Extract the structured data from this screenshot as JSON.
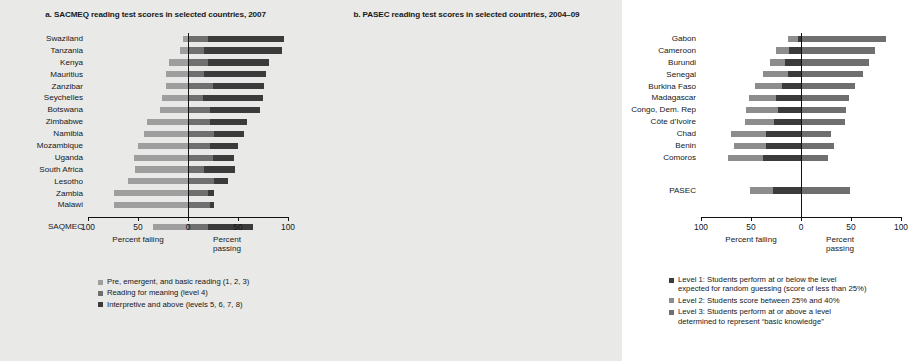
{
  "figure": {
    "background": "#e9e9e7",
    "axis_caption_left": "Percent failing",
    "axis_caption_right": "Percent passing"
  },
  "panels": [
    {
      "id": "a",
      "title": "a. SACMEQ reading test scores in selected countries, 2007",
      "xticks": [
        "100",
        "50",
        "0",
        "50",
        "100"
      ],
      "legend": [
        {
          "color": "#9e9e9e",
          "lines": [
            "Pre, emergent, and basic reading (1, 2, 3)"
          ]
        },
        {
          "color": "#6f6f6f",
          "lines": [
            "Reading for meaning (level 4)"
          ]
        },
        {
          "color": "#3b3b3b",
          "lines": [
            "Interpretive and above (levels 5, 6, 7, 8)"
          ]
        }
      ]
    },
    {
      "id": "b",
      "title": "b. PASEC reading test scores in selected countries, 2004–09",
      "xticks": [
        "100",
        "50",
        "0",
        "50",
        "100"
      ],
      "legend": [
        {
          "color": "#3b3b3b",
          "lines": [
            "Level 1: Students perform at or below the level",
            "expected for random guessing (score of less than 25%)"
          ]
        },
        {
          "color": "#8d8d8d",
          "lines": [
            "Level 2: Students score between 25% and 40%"
          ]
        },
        {
          "color": "#6f6f6f",
          "lines": [
            "Level 3: Students perform at or above a level",
            "determined to represent “basic knowledge”"
          ]
        }
      ]
    }
  ],
  "chart_data": [
    {
      "type": "bar",
      "orientation": "horizontal",
      "stacked": "diverging",
      "title": "a. SACMEQ reading test scores in selected countries, 2007",
      "xlabel_left": "Percent failing",
      "xlabel_right": "Percent passing",
      "xlim": [
        -100,
        100
      ],
      "xticks": [
        -100,
        -50,
        0,
        50,
        100
      ],
      "xticklabels": [
        "100",
        "50",
        "0",
        "50",
        "100"
      ],
      "grid": false,
      "legend_position": "below",
      "series": [
        {
          "name": "Pre, emergent, and basic reading (1, 2, 3)",
          "color": "#9e9e9e"
        },
        {
          "name": "Reading for meaning (level 4)",
          "color": "#6f6f6f"
        },
        {
          "name": "Interpretive and above (levels 5, 6, 7, 8)",
          "color": "#3b3b3b"
        }
      ],
      "categories": [
        "Swaziland",
        "Tanzania",
        "Kenya",
        "Mauritius",
        "Zanzibar",
        "Seychelles",
        "Botswana",
        "Zimbabwe",
        "Namibia",
        "Mozambique",
        "Uganda",
        "South Africa",
        "Lesotho",
        "Zambia",
        "Malawi",
        "SAQMEC"
      ],
      "rows": [
        {
          "category": "Swaziland",
          "failing": 5,
          "level4": 20,
          "above": 76,
          "start": -5,
          "mid": 20,
          "end": 96
        },
        {
          "category": "Tanzania",
          "failing": 8,
          "level4": 16,
          "above": 78,
          "start": -8,
          "mid": 16,
          "end": 94
        },
        {
          "category": "Kenya",
          "failing": 19,
          "level4": 20,
          "above": 61,
          "start": -19,
          "mid": 20,
          "end": 81
        },
        {
          "category": "Mauritius",
          "failing": 22,
          "level4": 16,
          "above": 62,
          "start": -22,
          "mid": 16,
          "end": 78
        },
        {
          "category": "Zanzibar",
          "failing": 22,
          "level4": 25,
          "above": 51,
          "start": -22,
          "mid": 25,
          "end": 76
        },
        {
          "category": "Seychelles",
          "failing": 26,
          "level4": 15,
          "above": 60,
          "start": -26,
          "mid": 15,
          "end": 75
        },
        {
          "category": "Botswana",
          "failing": 28,
          "level4": 22,
          "above": 50,
          "start": -28,
          "mid": 22,
          "end": 72
        },
        {
          "category": "Zimbabwe",
          "failing": 41,
          "level4": 22,
          "above": 37,
          "start": -41,
          "mid": 22,
          "end": 59
        },
        {
          "category": "Namibia",
          "failing": 44,
          "level4": 26,
          "above": 30,
          "start": -44,
          "mid": 26,
          "end": 56
        },
        {
          "category": "Mozambique",
          "failing": 50,
          "level4": 22,
          "above": 28,
          "start": -50,
          "mid": 22,
          "end": 50
        },
        {
          "category": "Uganda",
          "failing": 54,
          "level4": 25,
          "above": 21,
          "start": -54,
          "mid": 25,
          "end": 46
        },
        {
          "category": "South Africa",
          "failing": 53,
          "level4": 16,
          "above": 31,
          "start": -53,
          "mid": 16,
          "end": 47
        },
        {
          "category": "Lesotho",
          "failing": 60,
          "level4": 26,
          "above": 14,
          "start": -60,
          "mid": 26,
          "end": 40
        },
        {
          "category": "Zambia",
          "failing": 74,
          "level4": 20,
          "above": 6,
          "start": -74,
          "mid": 20,
          "end": 26
        },
        {
          "category": "Malawi",
          "failing": 74,
          "level4": 22,
          "above": 4,
          "start": -74,
          "mid": 22,
          "end": 26
        },
        {
          "category": "SAQMEC",
          "failing": 35,
          "level4": 20,
          "above": 45,
          "start": -35,
          "mid": 20,
          "end": 65
        }
      ]
    },
    {
      "type": "bar",
      "orientation": "horizontal",
      "stacked": "diverging",
      "title": "b. PASEC reading test scores in selected countries, 2004–09",
      "xlabel_left": "Percent failing",
      "xlabel_right": "Percent passing",
      "xlim": [
        -100,
        100
      ],
      "xticks": [
        -100,
        -50,
        0,
        50,
        100
      ],
      "xticklabels": [
        "100",
        "50",
        "0",
        "50",
        "100"
      ],
      "grid": false,
      "legend_position": "below",
      "series": [
        {
          "name": "Level 1: Students perform at or below the level expected for random guessing (score of less than 25%)",
          "color": "#3b3b3b"
        },
        {
          "name": "Level 2: Students score between 25% and 40%",
          "color": "#8d8d8d"
        },
        {
          "name": "Level 3: Students perform at or above a level determined to represent “basic knowledge”",
          "color": "#6f6f6f"
        }
      ],
      "categories": [
        "Gabon",
        "Cameroon",
        "Burundi",
        "Senegal",
        "Burkina Faso",
        "Madagascar",
        "Congo, Dem. Rep",
        "Côte d’Ivoire",
        "Chad",
        "Benin",
        "Comoros",
        "PASEC"
      ],
      "rows": [
        {
          "category": "Gabon",
          "level1": 10,
          "level2": 3,
          "level3": 85,
          "start": -13,
          "mid": -3,
          "end": 85
        },
        {
          "category": "Cameroon",
          "level1": 13,
          "level2": 12,
          "level3": 74,
          "start": -25,
          "mid": -12,
          "end": 74
        },
        {
          "category": "Burundi",
          "level1": 15,
          "level2": 16,
          "level3": 68,
          "start": -31,
          "mid": -16,
          "end": 68
        },
        {
          "category": "Senegal",
          "level1": 25,
          "level2": 13,
          "level3": 62,
          "start": -38,
          "mid": -13,
          "end": 62
        },
        {
          "category": "Burkina Faso",
          "level1": 27,
          "level2": 19,
          "level3": 54,
          "start": -46,
          "mid": -19,
          "end": 54
        },
        {
          "category": "Madagascar",
          "level1": 27,
          "level2": 25,
          "level3": 48,
          "start": -52,
          "mid": -25,
          "end": 48
        },
        {
          "category": "Congo, Dem. Rep",
          "level1": 32,
          "level2": 23,
          "level3": 45,
          "start": -55,
          "mid": -23,
          "end": 45
        },
        {
          "category": "Côte d’Ivoire",
          "level1": 29,
          "level2": 27,
          "level3": 44,
          "start": -56,
          "mid": -27,
          "end": 44
        },
        {
          "category": "Chad",
          "level1": 35,
          "level2": 35,
          "level3": 30,
          "start": -70,
          "mid": -35,
          "end": 30
        },
        {
          "category": "Benin",
          "level1": 32,
          "level2": 35,
          "level3": 33,
          "start": -67,
          "mid": -35,
          "end": 33
        },
        {
          "category": "Comoros",
          "level1": 35,
          "level2": 38,
          "level3": 27,
          "start": -73,
          "mid": -38,
          "end": 27
        },
        {
          "category": "PASEC",
          "level1": 23,
          "level2": 28,
          "level3": 49,
          "start": -51,
          "mid": -28,
          "end": 49
        }
      ]
    }
  ]
}
